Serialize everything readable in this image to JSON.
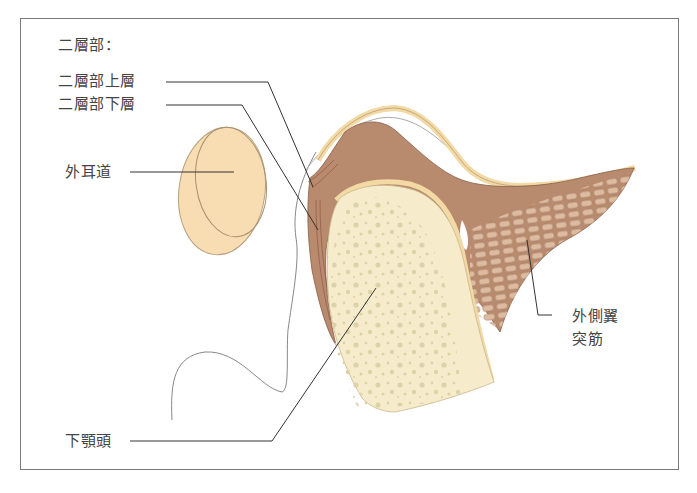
{
  "diagram": {
    "labels": {
      "bilaminar_zone_heading": "二層部：",
      "upper_layer": "二層部上層",
      "lower_layer": "二層部下層",
      "external_auditory_canal": "外耳道",
      "lateral_pterygoid_line1": "外側翼",
      "lateral_pterygoid_line2": "突筋",
      "mandibular_condyle": "下顎頭"
    },
    "colors": {
      "frame": "#7a7a7a",
      "label_text": "#444444",
      "leader_line": "#333333",
      "disc_muscle": "#b88a6e",
      "condyle_bone": "#f6eccb",
      "bone_pores": "#ddd2a8",
      "cartilage": "#f3d9a4",
      "ear_canal": "#f8dcb2",
      "muscle_fibers": "#d9b89c",
      "outline": "#9a8a7a"
    }
  }
}
